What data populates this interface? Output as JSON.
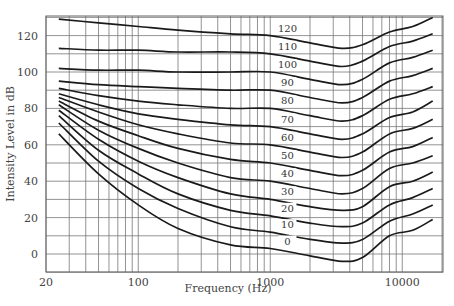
{
  "chart_data": {
    "type": "line",
    "title": "",
    "xlabel": "Frequency (Hz)",
    "ylabel": "Intensity Level in dB",
    "xscale": "log",
    "xlim": [
      20,
      20000
    ],
    "ylim": [
      -10,
      130
    ],
    "grid": true,
    "x_ticks": [
      20,
      100,
      1000,
      10000
    ],
    "x_tick_labels": [
      "20",
      "100",
      "1000",
      "10000"
    ],
    "y_ticks": [
      0,
      20,
      40,
      60,
      80,
      100,
      120
    ],
    "y_tick_labels": [
      "0",
      "20",
      "40",
      "60",
      "80",
      "100",
      "120"
    ],
    "x": [
      25,
      50,
      100,
      200,
      500,
      1000,
      2000,
      3500,
      5000,
      8000,
      12000,
      17000
    ],
    "series": [
      {
        "name": "0",
        "values": [
          66,
          44,
          27,
          14,
          5,
          3,
          -1,
          -4,
          -2,
          10,
          13,
          19
        ]
      },
      {
        "name": "10",
        "values": [
          72,
          51,
          36,
          25,
          15,
          12,
          8,
          6,
          8,
          18,
          22,
          27
        ]
      },
      {
        "name": "20",
        "values": [
          76,
          57,
          44,
          33,
          24,
          21,
          17,
          15,
          17,
          27,
          31,
          36
        ]
      },
      {
        "name": "30",
        "values": [
          79,
          63,
          51,
          42,
          33,
          30,
          26,
          24,
          26,
          37,
          40,
          45
        ]
      },
      {
        "name": "40",
        "values": [
          82,
          68,
          58,
          50,
          42,
          40,
          36,
          33,
          36,
          47,
          50,
          54
        ]
      },
      {
        "name": "50",
        "values": [
          84,
          73,
          65,
          58,
          52,
          50,
          46,
          43,
          46,
          56,
          59,
          64
        ]
      },
      {
        "name": "60",
        "values": [
          86,
          78,
          71,
          66,
          61,
          60,
          56,
          53,
          56,
          66,
          69,
          74
        ]
      },
      {
        "name": "70",
        "values": [
          88,
          82,
          77,
          74,
          71,
          70,
          66,
          63,
          66,
          75,
          78,
          84
        ]
      },
      {
        "name": "80",
        "values": [
          91,
          87,
          84,
          82,
          80,
          80,
          76,
          73,
          76,
          85,
          88,
          92
        ]
      },
      {
        "name": "90",
        "values": [
          95,
          93,
          92,
          91,
          90,
          90,
          86,
          83,
          86,
          95,
          98,
          102
        ]
      },
      {
        "name": "100",
        "values": [
          102,
          101,
          101,
          100,
          100,
          100,
          96,
          93,
          96,
          105,
          108,
          112
        ]
      },
      {
        "name": "110",
        "values": [
          113,
          112,
          112,
          111,
          111,
          110,
          106,
          103,
          106,
          114,
          117,
          121
        ]
      },
      {
        "name": "120",
        "values": [
          129,
          127,
          125,
          123,
          121,
          120,
          116,
          113,
          115,
          122,
          125,
          130
        ]
      }
    ],
    "curve_labels": [
      "120",
      "110",
      "100",
      "90",
      "80",
      "70",
      "60",
      "50",
      "40",
      "30",
      "20",
      "10",
      "0"
    ],
    "legend": "none"
  }
}
